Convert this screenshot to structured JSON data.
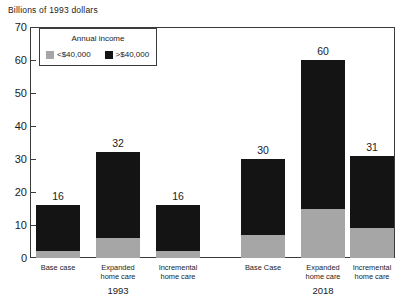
{
  "chart_data": {
    "type": "bar",
    "subtype": "grouped-stacked-bar",
    "title": "",
    "ylabel": "Billions of 1993 dollars",
    "xlabel": "",
    "ylim": [
      0,
      70
    ],
    "yticks": [
      0,
      10,
      20,
      30,
      40,
      50,
      60,
      70
    ],
    "ytick_labels": [
      "0",
      "10",
      "20",
      "30",
      "40",
      "50",
      "60",
      "70"
    ],
    "grid": false,
    "legend": {
      "title": "Annual income",
      "position": "inside-top-left",
      "entries": [
        {
          "label": "<$40,000",
          "color": "#a6a6a6",
          "swatch": "low-income-swatch"
        },
        {
          "label": ">$40,000",
          "color": "#141414",
          "swatch": "high-income-swatch"
        }
      ]
    },
    "series": [
      {
        "name": "<$40,000",
        "color": "#a6a6a6",
        "values": [
          14,
          26,
          14,
          23,
          45,
          22
        ]
      },
      {
        "name": ">$40,000",
        "color": "#141414",
        "values": [
          2,
          6,
          2,
          7,
          15,
          9
        ]
      }
    ],
    "categories": [
      "Base case",
      "Expanded home care",
      "Incremental home care",
      "Base Case",
      "Expanded home care",
      "Incremental home care"
    ],
    "totals": [
      16,
      32,
      16,
      30,
      60,
      31
    ],
    "groups": [
      {
        "label": "1993",
        "categories": [
          "Base case",
          "Expanded home care",
          "Incremental home care"
        ]
      },
      {
        "label": "2018",
        "categories": [
          "Base Case",
          "Expanded home care",
          "Incremental home care"
        ]
      }
    ]
  },
  "bars": [
    {
      "name": "bar-1993-base-case",
      "value_label": "16",
      "low": 14,
      "high": 2,
      "total": 16,
      "cat_line1": "Base case",
      "cat_line2": ""
    },
    {
      "name": "bar-1993-expanded-home-care",
      "value_label": "32",
      "low": 26,
      "high": 6,
      "total": 32,
      "cat_line1": "Expanded",
      "cat_line2": "home care"
    },
    {
      "name": "bar-1993-incremental-home-care",
      "value_label": "16",
      "low": 14,
      "high": 2,
      "total": 16,
      "cat_line1": "Incremental",
      "cat_line2": "home care"
    },
    {
      "name": "bar-2018-base-case",
      "value_label": "30",
      "low": 23,
      "high": 7,
      "total": 30,
      "cat_line1": "Base Case",
      "cat_line2": ""
    },
    {
      "name": "bar-2018-expanded-home-care",
      "value_label": "60",
      "low": 45,
      "high": 15,
      "total": 60,
      "cat_line1": "Expanded",
      "cat_line2": "home care"
    },
    {
      "name": "bar-2018-incremental-home-care",
      "value_label": "31",
      "low": 22,
      "high": 9,
      "total": 31,
      "cat_line1": "Incremental",
      "cat_line2": "home care"
    }
  ],
  "axis": {
    "title": "Billions of 1993 dollars",
    "ticks": [
      "70",
      "60",
      "50",
      "40",
      "30",
      "20",
      "10",
      "0"
    ]
  },
  "group_labels": [
    "1993",
    "2018"
  ],
  "legend": {
    "title": "Annual income",
    "low_label": "<$40,000",
    "high_label": ">$40,000"
  },
  "colors": {
    "low_income": "#a6a6a6",
    "high_income": "#141414",
    "axis": "#3b3b3b",
    "background": "#ffffff"
  }
}
